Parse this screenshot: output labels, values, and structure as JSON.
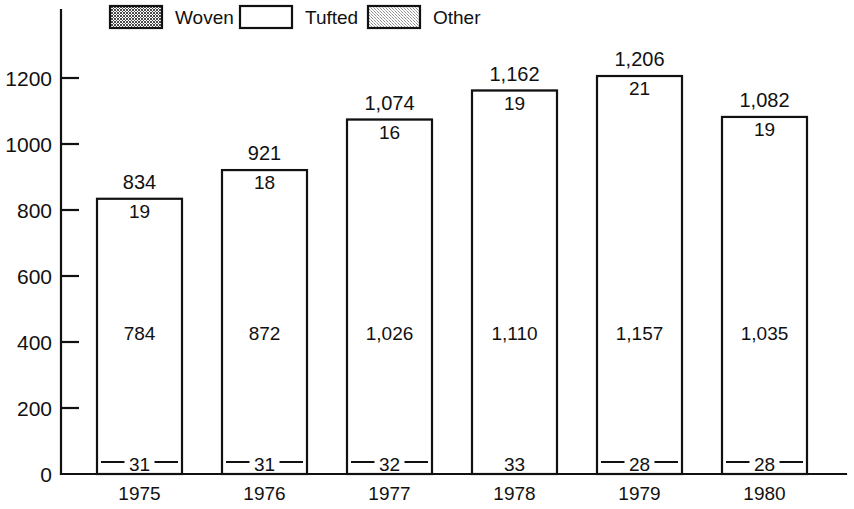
{
  "chart_data": {
    "type": "bar",
    "subtype": "stacked-bar",
    "title": "",
    "xlabel": "",
    "ylabel": "",
    "categories": [
      "1975",
      "1976",
      "1977",
      "1978",
      "1979",
      "1980"
    ],
    "series": [
      {
        "name": "Other",
        "values": [
          31,
          31,
          32,
          33,
          28,
          28
        ],
        "order": "bottom",
        "fill": "light-stipple"
      },
      {
        "name": "Tufted",
        "values": [
          784,
          872,
          1026,
          1110,
          1157,
          1035
        ],
        "order": "middle",
        "fill": "white"
      },
      {
        "name": "Woven",
        "values": [
          19,
          18,
          16,
          19,
          21,
          19
        ],
        "order": "top",
        "fill": "dark-stipple"
      }
    ],
    "totals": [
      834,
      921,
      1074,
      1162,
      1206,
      1082
    ],
    "total_labels": [
      "834",
      "921",
      "1,074",
      "1,162",
      "1,206",
      "1,082"
    ],
    "segment_labels": {
      "woven": [
        "19",
        "18",
        "16",
        "19",
        "21",
        "19"
      ],
      "tufted": [
        "784",
        "872",
        "1,026",
        "1,110",
        "1,157",
        "1,035"
      ],
      "other": [
        "31",
        "31",
        "32",
        "33",
        "28",
        "28"
      ]
    },
    "yticks": [
      0,
      200,
      400,
      600,
      800,
      1000,
      1200
    ],
    "ytick_labels": [
      "0",
      "200",
      "400",
      "600",
      "800",
      "1000",
      "1200"
    ],
    "ylim": [
      0,
      1360
    ],
    "grid": false,
    "legend": {
      "position": "top",
      "entries": [
        {
          "label": "Woven",
          "swatch": "dark-stipple"
        },
        {
          "label": "Tufted",
          "swatch": "white"
        },
        {
          "label": "Other",
          "swatch": "light-stipple"
        }
      ]
    },
    "colors": {
      "ink": "#111111",
      "background": "#ffffff",
      "woven_fill": "#6b6b6b",
      "tufted_fill": "#ffffff",
      "other_fill": "#d0d0d0"
    }
  },
  "legend": {
    "woven_label": "Woven",
    "tufted_label": "Tufted",
    "other_label": "Other"
  },
  "axis": {
    "y_labels": [
      "1200",
      "1000",
      "800",
      "600",
      "400",
      "200",
      "0"
    ],
    "x_labels": [
      "1975",
      "1976",
      "1977",
      "1978",
      "1979",
      "1980"
    ]
  }
}
